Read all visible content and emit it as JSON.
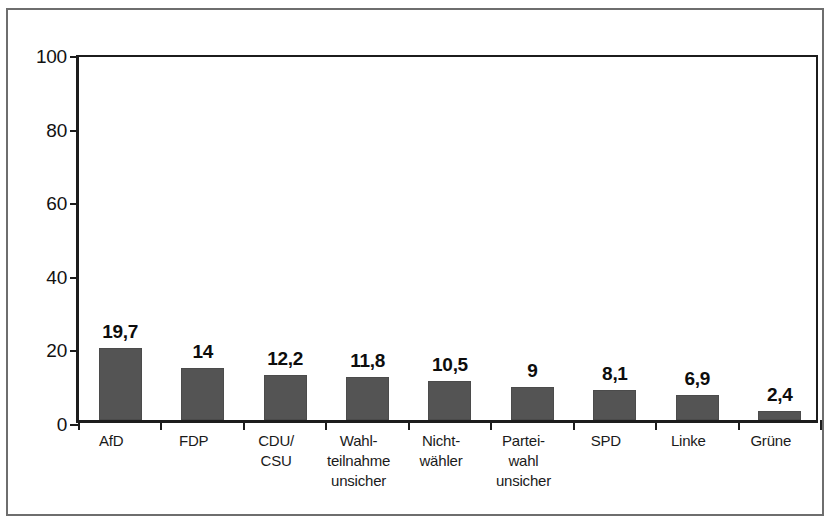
{
  "chart_data": {
    "type": "bar",
    "title": "",
    "subtitle": "",
    "xlabel": "",
    "ylabel": "",
    "ylim": [
      0,
      100
    ],
    "yticks": [
      0,
      20,
      40,
      60,
      80,
      100
    ],
    "ytick_labels": [
      "0",
      "20",
      "40",
      "60",
      "80",
      "100"
    ],
    "grid": false,
    "legend": false,
    "legend_position": "none",
    "decimal_separator": ",",
    "categories": [
      "AfD",
      "FDP",
      "CDU/CSU",
      "Wahlteilnahme unsicher",
      "Nichtwähler",
      "Parteiwahl unsicher",
      "SPD",
      "Linke",
      "Grüne"
    ],
    "category_lines": [
      [
        "AfD"
      ],
      [
        "FDP"
      ],
      [
        "CDU/",
        "CSU"
      ],
      [
        "Wahl-",
        "teilnahme",
        "unsicher"
      ],
      [
        "Nicht-",
        "wähler"
      ],
      [
        "Partei-",
        "wahl",
        "unsicher"
      ],
      [
        "SPD"
      ],
      [
        "Linke"
      ],
      [
        "Grüne"
      ]
    ],
    "values": [
      19.7,
      14,
      12.2,
      11.8,
      10.5,
      9,
      8.1,
      6.9,
      2.4
    ],
    "value_labels": [
      "19,7",
      "14",
      "12,2",
      "11,8",
      "10,5",
      "9",
      "8,1",
      "6,9",
      "2,4"
    ],
    "colors": {
      "bar_fill": "#545454",
      "axis": "#1c1c1c",
      "text": "#111111",
      "frame": "#6e6e6e",
      "background": "#ffffff"
    }
  }
}
